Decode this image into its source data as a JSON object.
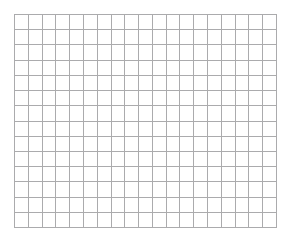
{
  "canvas": {
    "width": 290,
    "height": 244,
    "background_color": "#ffffff"
  },
  "grid": {
    "name": "empty-grid",
    "description": "Blank graph-paper style lattice of empty cells. No text, labels, axes, data, or annotations are rendered.",
    "left": 14,
    "top": 14,
    "width": 263,
    "height": 214,
    "columns": 19,
    "rows": 14,
    "cell_width": 13.84,
    "cell_height": 15.29,
    "line_color": "#ababad",
    "line_width": 1,
    "border_color": "#ababad",
    "fill_color": "#ffffff",
    "has_text": false,
    "has_header_row": false,
    "has_header_column": false,
    "cell_values": []
  }
}
